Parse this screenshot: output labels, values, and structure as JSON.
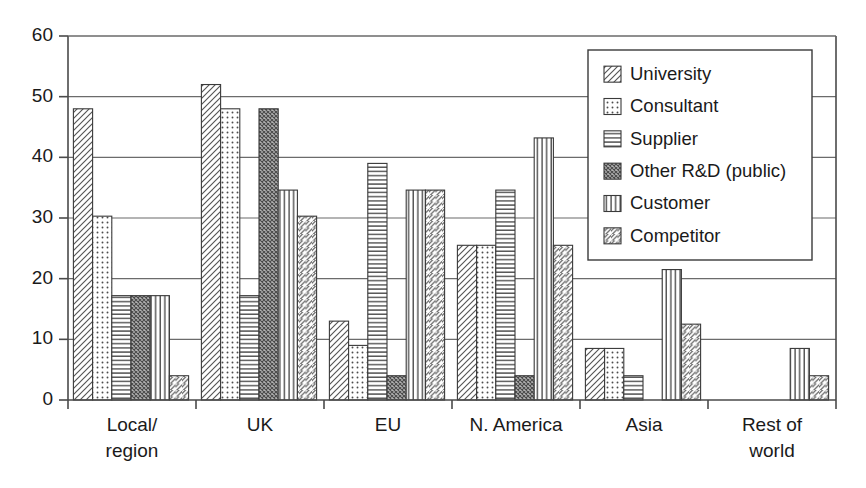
{
  "chart_data": {
    "type": "bar",
    "title": "",
    "subtitle": "",
    "xlabel": "",
    "ylabel": "",
    "ylim": [
      0,
      60
    ],
    "yticks": [
      0,
      10,
      20,
      30,
      40,
      50,
      60
    ],
    "ytick_labels": [
      "0",
      "10",
      "20",
      "30",
      "40",
      "50",
      "60"
    ],
    "grid": "horizontal",
    "legend_position": "top-right-inside",
    "categories": [
      "Local/\nregion",
      "UK",
      "EU",
      "N. America",
      "Asia",
      "Rest of\nworld"
    ],
    "category_labels": [
      [
        "Local/",
        "region"
      ],
      [
        "UK",
        ""
      ],
      [
        "EU",
        ""
      ],
      [
        "N. America",
        ""
      ],
      [
        "Asia",
        ""
      ],
      [
        "Rest of",
        "world"
      ]
    ],
    "series": [
      {
        "name": "University",
        "pattern": "diagonal-backslash",
        "values": [
          48,
          52,
          13,
          25.5,
          8.5,
          0
        ]
      },
      {
        "name": "Consultant",
        "pattern": "dots",
        "values": [
          30.3,
          48,
          9,
          25.5,
          8.5,
          0
        ]
      },
      {
        "name": "Supplier",
        "pattern": "horizontal-lines",
        "values": [
          17.2,
          17.2,
          39,
          34.6,
          4,
          0
        ]
      },
      {
        "name": "Other R&D (public)",
        "pattern": "cross-hatch",
        "values": [
          17.2,
          48,
          4,
          4,
          0,
          0
        ]
      },
      {
        "name": "Customer",
        "pattern": "vertical-lines",
        "values": [
          17.2,
          34.6,
          34.6,
          43.2,
          21.5,
          8.5
        ]
      },
      {
        "name": "Competitor",
        "pattern": "diagonal-slash",
        "values": [
          4,
          30.3,
          34.6,
          25.5,
          12.5,
          4
        ]
      }
    ]
  },
  "legend": {
    "items": [
      {
        "label": "University"
      },
      {
        "label": "Consultant"
      },
      {
        "label": "Supplier"
      },
      {
        "label": "Other R&D (public)"
      },
      {
        "label": "Customer"
      },
      {
        "label": "Competitor"
      }
    ]
  },
  "colors": {
    "background": "#ffffff",
    "axis": "#4a4a4a",
    "grid": "#6b6b6b",
    "bar_outline": "#3a3a3a",
    "bar_fill": "#ffffff",
    "pattern_stroke": "#555555",
    "text": "#1a1a1a"
  }
}
